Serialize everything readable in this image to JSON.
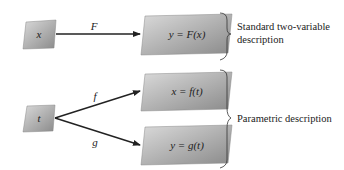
{
  "diagram": {
    "nodes": {
      "x_input": {
        "label": "x"
      },
      "F_output": {
        "label": "y = F(x)"
      },
      "t_input": {
        "label": "t"
      },
      "f_output": {
        "label": "x = f(t)"
      },
      "g_output": {
        "label": "y = g(t)"
      }
    },
    "edges": {
      "F": {
        "label": "F",
        "from": "x",
        "to": "y = F(x)"
      },
      "f": {
        "label": "f",
        "from": "t",
        "to": "x = f(t)"
      },
      "g": {
        "label": "g",
        "from": "t",
        "to": "y = g(t)"
      }
    },
    "descriptions": {
      "standard": {
        "line1": "Standard two-variable",
        "line2": "description"
      },
      "parametric": {
        "text": "Parametric description"
      }
    },
    "colors": {
      "box_light": "#d2d2d2",
      "box_dark": "#8e8e8e",
      "arrow": "#222222"
    }
  }
}
